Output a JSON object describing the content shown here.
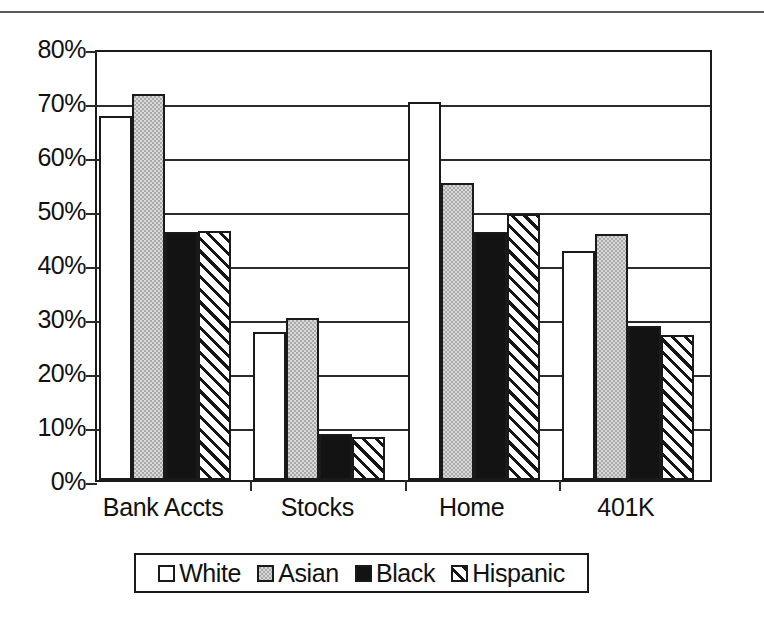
{
  "chart_data": {
    "type": "bar",
    "title": "",
    "subtitle": "",
    "xlabel": "",
    "ylabel": "",
    "categories": [
      "Bank Accts",
      "Stocks",
      "Home",
      "401K"
    ],
    "series": [
      {
        "name": "White",
        "pattern": "hollow",
        "values": [
          67.5,
          27.5,
          70.0,
          42.5
        ]
      },
      {
        "name": "Asian",
        "pattern": "gray-fill",
        "values": [
          71.5,
          30.0,
          55.0,
          45.5
        ]
      },
      {
        "name": "Black",
        "pattern": "solid-black",
        "values": [
          46.0,
          8.5,
          46.0,
          28.5
        ]
      },
      {
        "name": "Hispanic",
        "pattern": "diagonal-hatch",
        "values": [
          46.2,
          8.0,
          49.2,
          26.8
        ]
      }
    ],
    "ylim": [
      0,
      80
    ],
    "ytick_step": 10,
    "ytick_labels": [
      "0%",
      "10%",
      "20%",
      "30%",
      "40%",
      "50%",
      "60%",
      "70%",
      "80%"
    ],
    "ytick_values": [
      0,
      10,
      20,
      30,
      40,
      50,
      60,
      70,
      80
    ],
    "grid": true,
    "grid_axis": "y",
    "legend_position": "bottom",
    "legend_entries": [
      "White",
      "Asian",
      "Black",
      "Hispanic"
    ]
  },
  "colors": {
    "axis": "#1a1a1a",
    "grid": "#2b2b2b",
    "white_series": "#ffffff",
    "asian_series": "#a9a9a9",
    "black_series": "#131313",
    "hispanic_series": "#ffffff",
    "background": "#ffffff",
    "page_rule": "#595959"
  }
}
